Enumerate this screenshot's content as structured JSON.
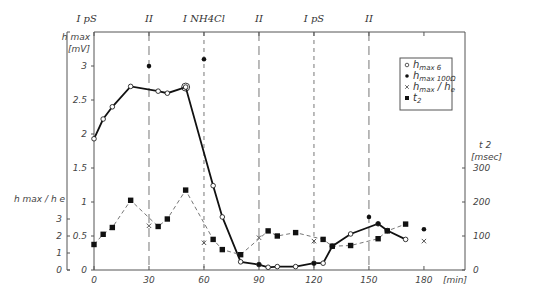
{
  "chart_data": {
    "type": "line",
    "title": "",
    "xlabel": "[min]",
    "x_ticks": [
      "0",
      "30",
      "60",
      "90",
      "120",
      "150",
      "180"
    ],
    "xlim": [
      0,
      195
    ],
    "axes": {
      "left_primary": {
        "label_line1": "h max",
        "label_line2": "[mV]",
        "ticks": [
          "0",
          "0.5",
          "1",
          "1.5",
          "2",
          "2.5",
          "3"
        ],
        "ylim": [
          0,
          3.3
        ]
      },
      "left_secondary": {
        "label": "h max / h e",
        "ticks": [
          "0",
          "1",
          "2",
          "3"
        ],
        "ylim": [
          0,
          3
        ]
      },
      "right": {
        "label_line1": "t 2",
        "label_line2": "[msec]",
        "ticks": [
          "0",
          "100",
          "200",
          "300"
        ],
        "ylim": [
          0,
          330
        ]
      }
    },
    "phase_markers": [
      {
        "label": "I pS",
        "x": 0,
        "line": false
      },
      {
        "label": "II",
        "x": 30,
        "line": true
      },
      {
        "label": "I NH4Cl",
        "x": 60,
        "line": true
      },
      {
        "label": "II",
        "x": 90,
        "line": true
      },
      {
        "label": "I pS",
        "x": 120,
        "line": true
      },
      {
        "label": "II",
        "x": 150,
        "line": true
      }
    ],
    "series": [
      {
        "name": "h max 6",
        "axis": "left_primary",
        "marker": "open-circle",
        "style": "solid-thick",
        "points": [
          [
            0,
            1.93
          ],
          [
            5,
            2.22
          ],
          [
            10,
            2.4
          ],
          [
            20,
            2.7
          ],
          [
            35,
            2.63
          ],
          [
            40,
            2.6
          ],
          [
            50,
            2.69
          ],
          [
            65,
            1.24
          ],
          [
            70,
            0.78
          ],
          [
            80,
            0.12
          ],
          [
            90,
            0.08
          ],
          [
            95,
            0.04
          ],
          [
            100,
            0.05
          ],
          [
            110,
            0.05
          ],
          [
            120,
            0.1
          ],
          [
            125,
            0.1
          ],
          [
            130,
            0.35
          ],
          [
            140,
            0.53
          ],
          [
            155,
            0.68
          ],
          [
            160,
            0.58
          ],
          [
            170,
            0.45
          ]
        ]
      },
      {
        "name": "h max 100Ω",
        "axis": "left_primary",
        "marker": "filled-dot",
        "style": "none",
        "points": [
          [
            30,
            3.0
          ],
          [
            60,
            3.1
          ],
          [
            90,
            0.08
          ],
          [
            120,
            0.1
          ],
          [
            150,
            0.78
          ],
          [
            155,
            0.68
          ],
          [
            180,
            0.6
          ]
        ]
      },
      {
        "name": "h max / h e",
        "axis": "left_secondary",
        "marker": "cross",
        "style": "none",
        "points": [
          [
            30,
            2.6
          ],
          [
            60,
            1.6
          ],
          [
            90,
            1.9
          ],
          [
            120,
            1.7
          ],
          [
            180,
            1.7
          ]
        ]
      },
      {
        "name": "t 2",
        "axis": "right",
        "marker": "filled-square",
        "style": "dashed",
        "points": [
          [
            0,
            75
          ],
          [
            5,
            105
          ],
          [
            10,
            125
          ],
          [
            20,
            205
          ],
          [
            35,
            128
          ],
          [
            40,
            150
          ],
          [
            50,
            235
          ],
          [
            65,
            90
          ],
          [
            70,
            60
          ],
          [
            80,
            45
          ],
          [
            95,
            115
          ],
          [
            100,
            100
          ],
          [
            110,
            110
          ],
          [
            125,
            90
          ],
          [
            130,
            70
          ],
          [
            140,
            72
          ],
          [
            155,
            92
          ],
          [
            160,
            115
          ],
          [
            170,
            135
          ]
        ]
      }
    ],
    "legend": {
      "placement": "top-right",
      "entries": [
        {
          "symbol": "open-circle",
          "main": "h",
          "sub": "max 6"
        },
        {
          "symbol": "filled-dot",
          "main": "h",
          "sub": "max 100Ω"
        },
        {
          "symbol": "cross",
          "main": "h",
          "sub": "max",
          "suffix": " / h",
          "suffix_sub": "e"
        },
        {
          "symbol": "filled-square",
          "main": "t",
          "sub": "2"
        }
      ]
    }
  }
}
